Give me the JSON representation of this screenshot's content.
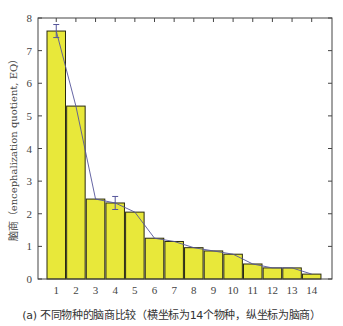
{
  "chart_data": {
    "type": "bar",
    "title": "",
    "caption": "(a) 不同物种的脑商比较（横坐标为14个物种，纵坐标为脑商）",
    "xlabel": "",
    "ylabel": "脑商（encephalization quotient, EQ）",
    "categories": [
      "1",
      "2",
      "3",
      "4",
      "5",
      "6",
      "7",
      "8",
      "9",
      "10",
      "11",
      "12",
      "13",
      "14"
    ],
    "values": [
      7.6,
      5.3,
      2.45,
      2.33,
      2.05,
      1.25,
      1.15,
      0.96,
      0.86,
      0.76,
      0.46,
      0.34,
      0.34,
      0.15
    ],
    "error_bars": [
      {
        "index": 0,
        "err": 0.2
      },
      {
        "index": 3,
        "err": 0.2
      }
    ],
    "trend_line": true,
    "ylim": [
      0,
      8
    ],
    "yticks": [
      0,
      1,
      2,
      3,
      4,
      5,
      6,
      7,
      8
    ],
    "grid": false,
    "legend": null,
    "colors": {
      "bar_fill": "#e8e83a",
      "bar_edge": "#2a2a10",
      "trend_line": "#55559a",
      "axis": "#444444"
    }
  }
}
